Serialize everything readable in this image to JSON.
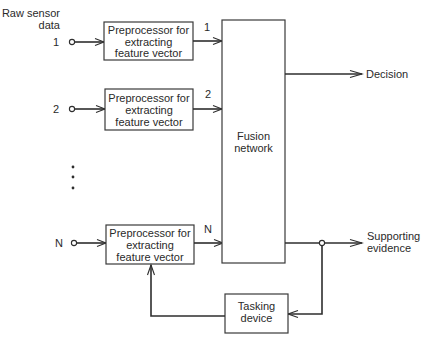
{
  "diagram": {
    "type": "block-diagram",
    "input_header": {
      "line1": "Raw sensor",
      "line2": "data"
    },
    "inputs": [
      {
        "label": "1"
      },
      {
        "label": "2"
      },
      {
        "label": "N"
      }
    ],
    "ellipsis": "⋮",
    "preprocessors": [
      {
        "line1": "Preprocessor for",
        "line2": "extracting",
        "line3": "feature vector",
        "output_label": "1"
      },
      {
        "line1": "Preprocessor for",
        "line2": "extracting",
        "line3": "feature vector",
        "output_label": "2"
      },
      {
        "line1": "Preprocessor for",
        "line2": "extracting",
        "line3": "feature vector",
        "output_label": "N"
      }
    ],
    "fusion": {
      "line1": "Fusion",
      "line2": "network"
    },
    "outputs": {
      "decision": "Decision",
      "supporting_line1": "Supporting",
      "supporting_line2": "evidence"
    },
    "tasking": {
      "line1": "Tasking",
      "line2": "device"
    },
    "colors": {
      "stroke": "#2e2e2e",
      "text": "#2a2a2a",
      "background": "#ffffff"
    }
  }
}
